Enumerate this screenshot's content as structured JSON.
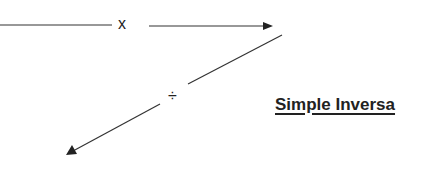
{
  "diagram": {
    "title": "Simple Inversa",
    "operators": {
      "multiply": "x",
      "divide": "÷"
    },
    "arrows": [
      {
        "from": "left",
        "to": "right",
        "label": "x"
      },
      {
        "from": "upper-right",
        "to": "lower-left",
        "label": "÷"
      }
    ],
    "colors": {
      "line": "#333333",
      "text": "#222222",
      "background": "#ffffff"
    }
  }
}
